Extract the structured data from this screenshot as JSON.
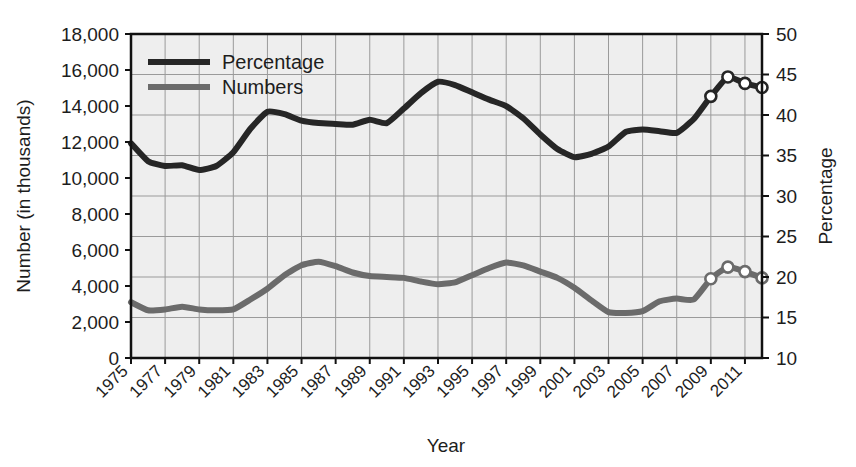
{
  "chart_data": {
    "type": "line",
    "title": "",
    "xlabel": "Year",
    "ylabel_left": "Number (in thousands)",
    "ylabel_right": "Percentage",
    "grid": true,
    "legend_position": "top-left-inside",
    "plot_background": "#eeeeee",
    "x": [
      1975,
      1976,
      1977,
      1978,
      1979,
      1980,
      1981,
      1982,
      1983,
      1984,
      1985,
      1986,
      1987,
      1988,
      1989,
      1990,
      1991,
      1992,
      1993,
      1994,
      1995,
      1996,
      1997,
      1998,
      1999,
      2000,
      2001,
      2002,
      2003,
      2004,
      2005,
      2006,
      2007,
      2008,
      2009,
      2010,
      2011,
      2012
    ],
    "xtick_labels": [
      "1975",
      "1977",
      "1979",
      "1981",
      "1983",
      "1985",
      "1987",
      "1989",
      "1991",
      "1993",
      "1995",
      "1997",
      "1999",
      "2001",
      "2003",
      "2005",
      "2007",
      "2009",
      "2011"
    ],
    "xtick_values": [
      1975,
      1977,
      1979,
      1981,
      1983,
      1985,
      1987,
      1989,
      1991,
      1993,
      1995,
      1997,
      1999,
      2001,
      2003,
      2005,
      2007,
      2009,
      2011
    ],
    "xlim": [
      1975,
      2012
    ],
    "left_axis": {
      "ticks": [
        0,
        2000,
        4000,
        6000,
        8000,
        10000,
        12000,
        14000,
        16000,
        18000
      ],
      "tick_labels": [
        "0",
        "2,000",
        "4,000",
        "6,000",
        "8,000",
        "10,000",
        "12,000",
        "14,000",
        "16,000",
        "18,000"
      ],
      "ylim": [
        0,
        18000
      ]
    },
    "right_axis": {
      "ticks": [
        10,
        15,
        20,
        25,
        30,
        35,
        40,
        45,
        50
      ],
      "tick_labels": [
        "10",
        "15",
        "20",
        "25",
        "30",
        "35",
        "40",
        "45",
        "50"
      ],
      "ylim": [
        10,
        50
      ]
    },
    "series": [
      {
        "name": "Percentage",
        "axis": "right",
        "color": "#262626",
        "width": 6,
        "values": [
          36.5,
          34.3,
          33.7,
          33.8,
          33.2,
          33.7,
          35.4,
          38.3,
          40.4,
          40.1,
          39.3,
          39.0,
          38.9,
          38.8,
          39.4,
          39.0,
          40.8,
          42.7,
          44.1,
          43.7,
          42.8,
          41.9,
          41.1,
          39.6,
          37.6,
          35.8,
          34.8,
          35.2,
          36.1,
          37.9,
          38.2,
          38.0,
          37.8,
          39.5,
          42.3,
          44.7,
          43.9,
          43.4
        ],
        "markers_from_year": 2009,
        "marker_style": "open-circle"
      },
      {
        "name": "Numbers",
        "axis": "left",
        "color": "#6b6b6b",
        "width": 6,
        "values": [
          3100,
          2650,
          2700,
          2850,
          2700,
          2650,
          2700,
          3250,
          3850,
          4600,
          5150,
          5350,
          5100,
          4750,
          4550,
          4500,
          4450,
          4250,
          4100,
          4200,
          4600,
          5000,
          5300,
          5150,
          4800,
          4450,
          3900,
          3200,
          2550,
          2500,
          2600,
          3150,
          3300,
          3250,
          3100,
          3800,
          4550,
          5050
        ],
        "numbers_override": [
          3100,
          2650,
          2700,
          2850,
          2700,
          2650,
          2700,
          3250,
          3850,
          4600,
          5150,
          5350,
          5100,
          4750,
          4550,
          4500,
          4450,
          4250,
          4100,
          4200,
          4600,
          5000,
          5300,
          5150,
          4800,
          4450,
          3900,
          3200,
          2550,
          2500,
          2600,
          3150,
          3300,
          3250,
          4400,
          5050,
          4800,
          4450
        ],
        "markers_from_year": 2009,
        "marker_style": "open-circle"
      }
    ],
    "annotations": []
  },
  "legend": {
    "items": [
      {
        "label": "Percentage",
        "color": "#262626"
      },
      {
        "label": "Numbers",
        "color": "#6b6b6b"
      }
    ]
  },
  "axes": {
    "x_title": "Year",
    "y_left_title": "Number (in thousands)",
    "y_right_title": "Percentage"
  }
}
